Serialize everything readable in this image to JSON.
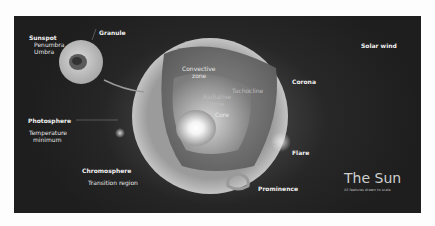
{
  "diagram": {
    "title": "The Sun",
    "subtitle": "All features drawn to scale",
    "inset_labels": {
      "sunspot": "Sunspot",
      "penumbra": "Penumbra",
      "umbra": "Umbra",
      "granule": "Granule"
    },
    "interior_labels": {
      "convective_zone_1": "Convective",
      "convective_zone_2": "zone",
      "radiative_zone_1": "Radiative",
      "radiative_zone_2": "zone",
      "core": "Core",
      "tachocline": "Tachocline"
    },
    "layer_labels": {
      "photosphere": "Photosphere",
      "temperature_minimum_1": "Temperature",
      "temperature_minimum_2": "minimum",
      "chromosphere": "Chromosphere",
      "transition_region": "Transition region",
      "corona": "Corona",
      "solar_wind": "Solar wind",
      "flare": "Flare",
      "prominence": "Prominence"
    },
    "colors": {
      "background": "#1e1e1e",
      "page": "#fdfdfd",
      "label": "#e6e6e6"
    }
  }
}
